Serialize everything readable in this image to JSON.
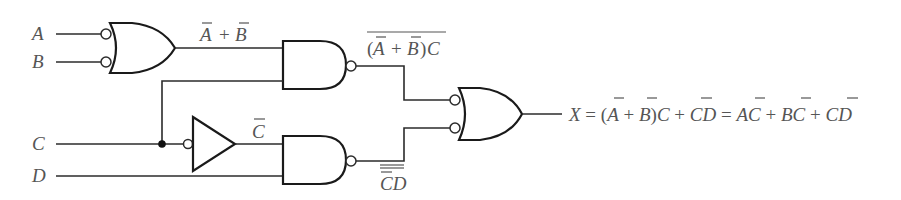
{
  "diagram": {
    "type": "logic-circuit",
    "inputs": [
      {
        "name": "A",
        "label": "A"
      },
      {
        "name": "B",
        "label": "B"
      },
      {
        "name": "C",
        "label": "C"
      },
      {
        "name": "D",
        "label": "D"
      }
    ],
    "gates": [
      {
        "id": "or1",
        "type": "OR",
        "inverted_inputs": true,
        "inputs": [
          "A",
          "B"
        ],
        "output_label": "A̅ + B̅"
      },
      {
        "id": "nand1",
        "type": "NAND",
        "inputs": [
          "or1",
          "C"
        ],
        "output_label": "(A̅ + B̅)C (overbar)"
      },
      {
        "id": "not1",
        "type": "NOT",
        "inputs": [
          "C"
        ],
        "output_label": "C̅"
      },
      {
        "id": "nand2",
        "type": "NAND",
        "inputs": [
          "not1",
          "D"
        ],
        "output_label": "C̅D (double overbar)"
      },
      {
        "id": "or2",
        "type": "OR",
        "inverted_inputs": true,
        "inputs": [
          "nand1",
          "nand2"
        ],
        "output_label": "X"
      }
    ],
    "labels": {
      "a": "A",
      "b": "B",
      "c": "C",
      "d": "D",
      "or1_out_a": "A",
      "or1_out_plus": "+",
      "or1_out_b": "B",
      "nand1_out_open": "(",
      "nand1_out_a": "A",
      "nand1_out_plus": "+",
      "nand1_out_b": "B",
      "nand1_out_close": ")",
      "nand1_out_c": "C",
      "not_out_c": "C",
      "nand2_out_cd": "CD"
    },
    "output_expression": {
      "full_text": "X = (A̅ + B̅)C + C̅D = A̅C + B̅C + C̅D",
      "x": "X",
      "eq1": " = (",
      "a1": "A",
      "plus1": " + ",
      "b1": "B",
      "close1": ")",
      "c1": "C",
      "plus2": " + ",
      "c2": "C",
      "d1": "D",
      "eq2": " = ",
      "a2": "A",
      "c3": "C",
      "plus3": " + ",
      "b2": "B",
      "c4": "C",
      "plus4": " + ",
      "c5": "C",
      "d2": "D"
    }
  }
}
